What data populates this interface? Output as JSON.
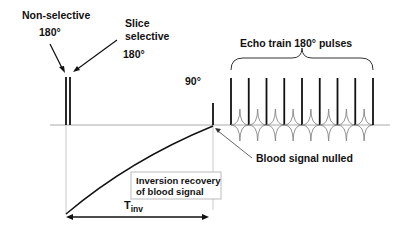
{
  "diagram": {
    "labels": {
      "nonselective_line1": "Non-selective",
      "nonselective_line2": "180°",
      "slice_line1": "Slice",
      "slice_line2": "selective",
      "slice_line3": "180°",
      "ninety": "90°",
      "echo_train": "Echo train 180° pulses",
      "blood_nulled": "Blood signal nulled",
      "recovery_line1": "Inversion recovery",
      "recovery_line2": "of blood signal",
      "tinv_main": "T",
      "tinv_sub": "inv"
    },
    "colors": {
      "pulse": "#111111",
      "baseline": "#aaaaaa",
      "echo": "#888888",
      "text": "#111111"
    },
    "echo_pulse_count": 9
  }
}
